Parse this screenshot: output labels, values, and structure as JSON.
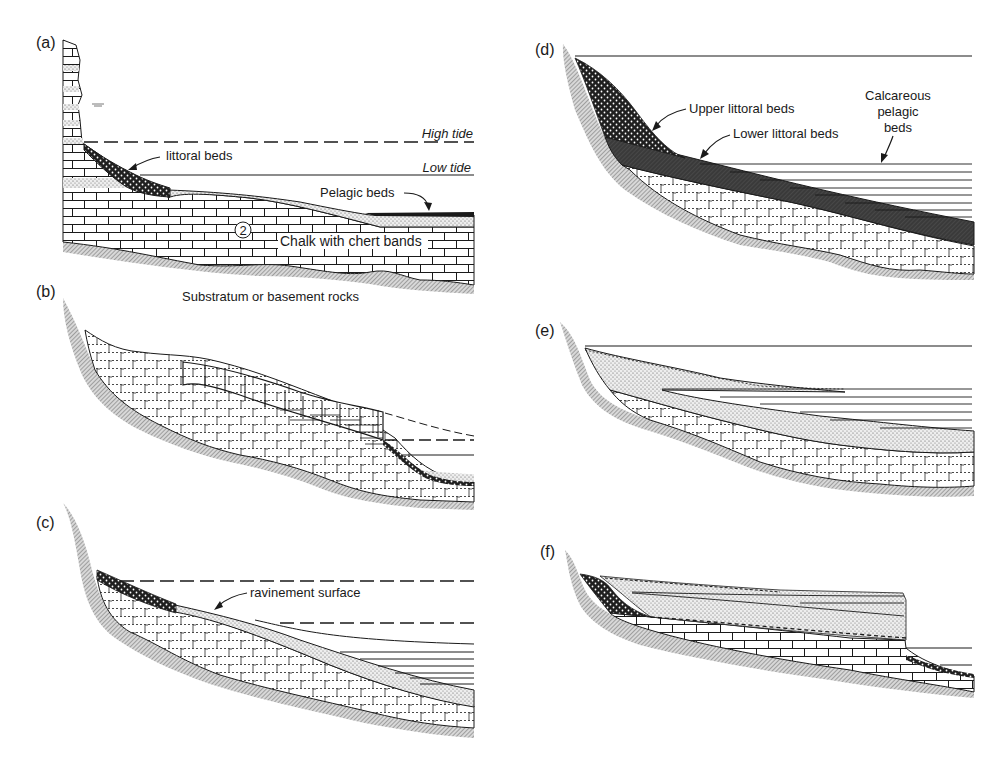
{
  "figure": {
    "colors": {
      "ink": "#1a1a1a",
      "basement_hatch": "#9a9a9a",
      "lower_littoral_fill": "#3a3a3a",
      "sand_fill": "#e8e8e8",
      "background": "#ffffff"
    }
  },
  "panels": {
    "a": {
      "label": "(a)",
      "high_tide": "High tide",
      "low_tide": "Low tide",
      "littoral_beds": "littoral beds",
      "pelagic_beds": "Pelagic beds",
      "circle_number": "2",
      "chalk": "Chalk with chert bands",
      "substratum": "Substratum or basement rocks"
    },
    "b": {
      "label": "(b)"
    },
    "c": {
      "label": "(c)",
      "ravinement": "ravinement surface"
    },
    "d": {
      "label": "(d)",
      "upper_littoral": "Upper littoral beds",
      "lower_littoral": "Lower littoral beds",
      "calcareous_line1": "Calcareous",
      "calcareous_line2": "pelagic",
      "calcareous_line3": "beds"
    },
    "e": {
      "label": "(e)"
    },
    "f": {
      "label": "(f)"
    }
  }
}
